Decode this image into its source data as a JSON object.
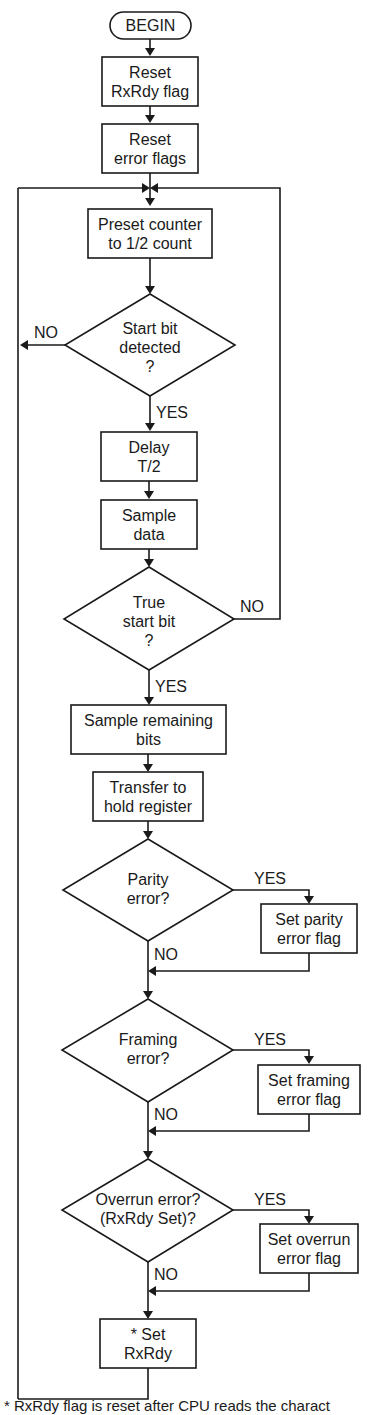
{
  "flowchart": {
    "begin": "BEGIN",
    "reset_rxrdy": [
      "Reset",
      "RxRdy flag"
    ],
    "reset_errors": [
      "Reset",
      "error flags"
    ],
    "preset_counter": [
      "Preset counter",
      "to 1/2 count"
    ],
    "start_bit_detected": [
      "Start bit",
      "detected",
      "?"
    ],
    "delay": [
      "Delay",
      "T/2"
    ],
    "sample_data": [
      "Sample",
      "data"
    ],
    "true_start_bit": [
      "True",
      "start bit",
      "?"
    ],
    "sample_remaining": [
      "Sample remaining",
      "bits"
    ],
    "transfer_hold": [
      "Transfer to",
      "hold register"
    ],
    "parity_error": [
      "Parity",
      "error?"
    ],
    "set_parity": [
      "Set parity",
      "error flag"
    ],
    "framing_error": [
      "Framing",
      "error?"
    ],
    "set_framing": [
      "Set framing",
      "error flag"
    ],
    "overrun_error": [
      "Overrun error?",
      "(RxRdy Set)?"
    ],
    "set_overrun": [
      "Set overrun",
      "error flag"
    ],
    "set_rxrdy": [
      "* Set",
      "RxRdy"
    ],
    "labels": {
      "no_start": "NO",
      "yes_start": "YES",
      "no_true": "NO",
      "yes_true": "YES",
      "yes_parity": "YES",
      "no_parity": "NO",
      "yes_framing": "YES",
      "no_framing": "NO",
      "yes_overrun": "YES",
      "no_overrun": "NO"
    },
    "caption": "* RxRdy flag is reset after CPU reads the charact"
  }
}
